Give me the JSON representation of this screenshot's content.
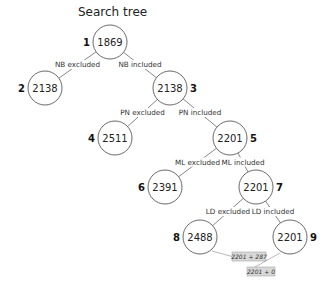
{
  "title": "Search tree",
  "nodes": [
    {
      "id": 1,
      "value": "1869",
      "index_label": "1"
    },
    {
      "id": 2,
      "value": "2138",
      "index_label": "2"
    },
    {
      "id": 3,
      "value": "2138",
      "index_label": "3"
    },
    {
      "id": 4,
      "value": "2511",
      "index_label": "4"
    },
    {
      "id": 5,
      "value": "2201",
      "index_label": "5"
    },
    {
      "id": 6,
      "value": "2391",
      "index_label": "6"
    },
    {
      "id": 7,
      "value": "2201",
      "index_label": "7"
    },
    {
      "id": 8,
      "value": "2488",
      "index_label": "8"
    },
    {
      "id": 9,
      "value": "2201",
      "index_label": "9"
    }
  ],
  "edges": [
    {
      "from": 1,
      "to": 2,
      "label": "NB excluded"
    },
    {
      "from": 1,
      "to": 3,
      "label": "NB included"
    },
    {
      "from": 3,
      "to": 4,
      "label": "PN excluded"
    },
    {
      "from": 3,
      "to": 5,
      "label": "PN included"
    },
    {
      "from": 5,
      "to": 6,
      "label": "ML excluded"
    },
    {
      "from": 5,
      "to": 7,
      "label": "ML included"
    },
    {
      "from": 7,
      "to": 8,
      "label": "LD excluded"
    },
    {
      "from": 7,
      "to": 9,
      "label": "LD included"
    }
  ],
  "annotations": [
    {
      "node": 8,
      "text": "2201 + 287"
    },
    {
      "node": 9,
      "text": "2201 + 0"
    }
  ]
}
